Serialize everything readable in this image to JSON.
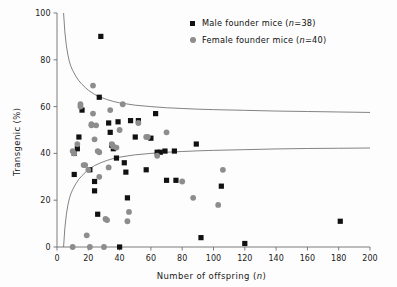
{
  "chart_data": {
    "type": "scatter",
    "title": "",
    "xlabel": "Number of offspring (n)",
    "ylabel": "Transgenic (%)",
    "xlim": [
      0,
      200
    ],
    "ylim": [
      0,
      100
    ],
    "xticks": [
      0,
      20,
      40,
      60,
      80,
      100,
      120,
      140,
      160,
      180,
      200
    ],
    "yticks": [
      0,
      20,
      40,
      60,
      80,
      100
    ],
    "grid": false,
    "legend_position": "top-right",
    "legend": [
      {
        "label": "Male founder mice (n=38)",
        "marker": "square",
        "color": "#111111",
        "n": 38
      },
      {
        "label": "Female founder mice (n=40)",
        "marker": "circle",
        "color": "#8d8d8d",
        "n": 40
      }
    ],
    "series": [
      {
        "name": "Male founder mice",
        "marker": "square",
        "color": "#111111",
        "n": 38,
        "points": [
          [
            28,
            90
          ],
          [
            27,
            64
          ],
          [
            16,
            58.5
          ],
          [
            14,
            47
          ],
          [
            13,
            42
          ],
          [
            11,
            40
          ],
          [
            11,
            31
          ],
          [
            21,
            33
          ],
          [
            24,
            28
          ],
          [
            24,
            24
          ],
          [
            26,
            14
          ],
          [
            33,
            53
          ],
          [
            34,
            49
          ],
          [
            35,
            43.5
          ],
          [
            36,
            42
          ],
          [
            38,
            38
          ],
          [
            39,
            53.5
          ],
          [
            40,
            0
          ],
          [
            43,
            36
          ],
          [
            44,
            32
          ],
          [
            45,
            21
          ],
          [
            50,
            47
          ],
          [
            52,
            54
          ],
          [
            57,
            33
          ],
          [
            60,
            46.5
          ],
          [
            63,
            57
          ],
          [
            64,
            40.5
          ],
          [
            66,
            40.5
          ],
          [
            69,
            41
          ],
          [
            70,
            28.5
          ],
          [
            75,
            41
          ],
          [
            76,
            28.5
          ],
          [
            89,
            44
          ],
          [
            92,
            4
          ],
          [
            105,
            26
          ],
          [
            120,
            1.5
          ],
          [
            181,
            11
          ],
          [
            47,
            54
          ]
        ]
      },
      {
        "name": "Female founder mice",
        "marker": "circle",
        "color": "#8d8d8d",
        "n": 40,
        "points": [
          [
            10,
            0
          ],
          [
            10,
            41
          ],
          [
            11,
            40
          ],
          [
            13,
            44
          ],
          [
            15,
            60
          ],
          [
            15,
            61
          ],
          [
            17,
            35
          ],
          [
            18,
            35
          ],
          [
            19,
            5
          ],
          [
            20,
            33
          ],
          [
            21,
            0
          ],
          [
            22,
            52
          ],
          [
            22,
            52.5
          ],
          [
            23,
            69
          ],
          [
            23,
            57
          ],
          [
            24,
            46
          ],
          [
            25,
            52
          ],
          [
            26,
            41
          ],
          [
            27,
            40.5
          ],
          [
            27,
            30
          ],
          [
            30,
            0
          ],
          [
            31,
            12
          ],
          [
            32,
            11.5
          ],
          [
            33,
            34
          ],
          [
            34,
            58.5
          ],
          [
            35,
            44
          ],
          [
            36,
            43
          ],
          [
            38,
            42.5
          ],
          [
            40,
            50
          ],
          [
            42,
            61
          ],
          [
            45,
            11
          ],
          [
            46,
            15
          ],
          [
            52,
            53
          ],
          [
            57,
            47
          ],
          [
            58,
            47
          ],
          [
            64,
            39
          ],
          [
            70,
            49
          ],
          [
            80,
            28
          ],
          [
            87,
            21
          ],
          [
            103,
            18
          ],
          [
            106,
            33
          ]
        ]
      }
    ],
    "curves": [
      {
        "name": "upper-confidence-bound",
        "color": "#6d6d6d",
        "asymptote": 57.5,
        "points": [
          [
            4.2,
            100
          ],
          [
            5,
            92
          ],
          [
            6,
            86
          ],
          [
            7,
            82
          ],
          [
            8,
            79
          ],
          [
            9,
            77
          ],
          [
            10,
            75.5
          ],
          [
            12,
            73
          ],
          [
            14,
            71
          ],
          [
            16,
            69.5
          ],
          [
            18,
            68.2
          ],
          [
            20,
            67
          ],
          [
            24,
            65.2
          ],
          [
            28,
            64
          ],
          [
            32,
            63
          ],
          [
            36,
            62.2
          ],
          [
            40,
            61.6
          ],
          [
            50,
            60.6
          ],
          [
            60,
            60
          ],
          [
            70,
            59.5
          ],
          [
            80,
            59.2
          ],
          [
            90,
            58.9
          ],
          [
            100,
            58.7
          ],
          [
            120,
            58.4
          ],
          [
            140,
            58.1
          ],
          [
            160,
            57.9
          ],
          [
            180,
            57.7
          ],
          [
            200,
            57.5
          ]
        ]
      },
      {
        "name": "lower-confidence-bound",
        "color": "#6d6d6d",
        "asymptote": 42.3,
        "points": [
          [
            4.2,
            0
          ],
          [
            5,
            8
          ],
          [
            6,
            14
          ],
          [
            7,
            18
          ],
          [
            8,
            21
          ],
          [
            9,
            23
          ],
          [
            10,
            24.5
          ],
          [
            12,
            27
          ],
          [
            14,
            29
          ],
          [
            16,
            30.5
          ],
          [
            18,
            31.8
          ],
          [
            20,
            33
          ],
          [
            24,
            34.8
          ],
          [
            28,
            36
          ],
          [
            32,
            37
          ],
          [
            36,
            37.8
          ],
          [
            40,
            38.4
          ],
          [
            50,
            39.4
          ],
          [
            60,
            40
          ],
          [
            70,
            40.5
          ],
          [
            80,
            40.8
          ],
          [
            90,
            41.1
          ],
          [
            100,
            41.3
          ],
          [
            120,
            41.6
          ],
          [
            140,
            41.9
          ],
          [
            160,
            42.1
          ],
          [
            180,
            42.2
          ],
          [
            200,
            42.3
          ]
        ]
      }
    ]
  },
  "axes": {
    "xlabel_prefix": "Number of offspring (",
    "xlabel_italic": "n",
    "xlabel_suffix": ")",
    "ylabel_text": "Transgenic (%)"
  },
  "legend_items": {
    "male_prefix": "Male founder mice (",
    "male_italic": "n",
    "male_suffix": "=38)",
    "female_prefix": "Female founder mice (",
    "female_italic": "n",
    "female_suffix": "=40)"
  }
}
